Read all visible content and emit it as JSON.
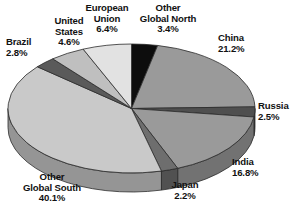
{
  "chart_data": {
    "type": "pie",
    "title": "",
    "title_fragment": "",
    "unit": "%",
    "three_d": true,
    "start_angle_deg": 0,
    "direction": "clockwise",
    "legend": "none",
    "categories": [
      "Other Global North",
      "China",
      "Russia",
      "India",
      "Japan",
      "Other Global South",
      "Brazil",
      "United States",
      "European Union"
    ],
    "values": [
      3.4,
      21.2,
      2.5,
      16.8,
      2.2,
      40.1,
      2.8,
      4.6,
      6.4
    ],
    "colors": [
      "#0d0d0d",
      "#9a9a9a",
      "#4f4f4f",
      "#9a9a9a",
      "#6e6e6e",
      "#c9c9c9",
      "#5a5a5a",
      "#bfbfbf",
      "#e2e2e2"
    ],
    "slices": [
      {
        "name": "Other Global North",
        "value": 3.4,
        "label_lines": [
          "Other",
          "Global North",
          "3.4%"
        ],
        "color": "#0d0d0d"
      },
      {
        "name": "China",
        "value": 21.2,
        "label_lines": [
          "China",
          "21.2%"
        ],
        "color": "#9a9a9a"
      },
      {
        "name": "Russia",
        "value": 2.5,
        "label_lines": [
          "Russia",
          "2.5%"
        ],
        "color": "#4f4f4f"
      },
      {
        "name": "India",
        "value": 16.8,
        "label_lines": [
          "India",
          "16.8%"
        ],
        "color": "#9a9a9a"
      },
      {
        "name": "Japan",
        "value": 2.2,
        "label_lines": [
          "Japan",
          "2.2%"
        ],
        "color": "#6e6e6e"
      },
      {
        "name": "Other Global South",
        "value": 40.1,
        "label_lines": [
          "Other",
          "Global South",
          "40.1%"
        ],
        "color": "#c9c9c9"
      },
      {
        "name": "Brazil",
        "value": 2.8,
        "label_lines": [
          "Brazil",
          "2.8%"
        ],
        "color": "#5a5a5a"
      },
      {
        "name": "United States",
        "value": 4.6,
        "label_lines": [
          "United",
          "States",
          "4.6%"
        ],
        "color": "#bfbfbf"
      },
      {
        "name": "European Union",
        "value": 6.4,
        "label_lines": [
          "European",
          "Union",
          "6.4%"
        ],
        "color": "#e2e2e2"
      }
    ]
  },
  "labels": {
    "brazil": {
      "l1": "Brazil",
      "l2": "2.8%",
      "l3": ""
    },
    "united_states": {
      "l1": "United",
      "l2": "States",
      "l3": "4.6%"
    },
    "european_union": {
      "l1": "European",
      "l2": "Union",
      "l3": "6.4%"
    },
    "other_north": {
      "l1": "Other",
      "l2": "Global North",
      "l3": "3.4%"
    },
    "china": {
      "l1": "China",
      "l2": "21.2%",
      "l3": ""
    },
    "russia": {
      "l1": "Russia",
      "l2": "2.5%",
      "l3": ""
    },
    "india": {
      "l1": "India",
      "l2": "16.8%",
      "l3": ""
    },
    "japan": {
      "l1": "Japan",
      "l2": "2.2%",
      "l3": ""
    },
    "other_south": {
      "l1": "Other",
      "l2": "Global South",
      "l3": "40.1%"
    }
  }
}
